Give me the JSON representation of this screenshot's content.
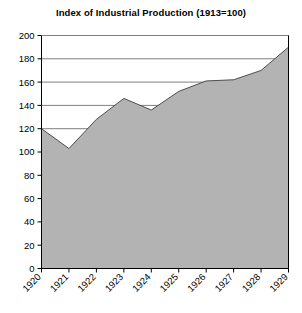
{
  "chart_data": {
    "type": "area",
    "title": "Index of Industrial Production (1913=100)",
    "xlabel": "",
    "ylabel": "",
    "categories": [
      "1920",
      "1921",
      "1922",
      "1923",
      "1924",
      "1925",
      "1926",
      "1927",
      "1928",
      "1929"
    ],
    "values": [
      120,
      103,
      128,
      146,
      136,
      152,
      161,
      162,
      170,
      190
    ],
    "series": [
      {
        "name": "Index of Industrial Production",
        "values": [
          120,
          103,
          128,
          146,
          136,
          152,
          161,
          162,
          170,
          190
        ]
      }
    ],
    "ylim": [
      0,
      200
    ],
    "ytick_labels": [
      "0",
      "20",
      "40",
      "60",
      "80",
      "100",
      "120",
      "140",
      "160",
      "180",
      "200"
    ],
    "ytick_values": [
      0,
      20,
      40,
      60,
      80,
      100,
      120,
      140,
      160,
      180,
      200
    ],
    "xtick_labels": [
      "1920",
      "1921",
      "1922",
      "1923",
      "1924",
      "1925",
      "1926",
      "1927",
      "1928",
      "1929"
    ],
    "grid": true,
    "grid_axis": "y",
    "legend": false,
    "legend_position": "none",
    "xtick_rotation": 45,
    "colors": {
      "area_fill": "#b3b3b3",
      "area_line": "#4d4d4d",
      "grid": "#808080",
      "axis": "#000000",
      "text": "#000000",
      "background": "#ffffff"
    }
  }
}
